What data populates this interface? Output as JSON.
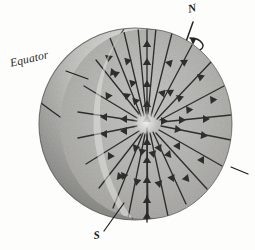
{
  "figure": {
    "background_color": "#fdfdfc",
    "ink_color": "#1d1d1d"
  },
  "labels": {
    "equator": "Equator",
    "north_pole": "N",
    "south_pole": "S"
  },
  "diagram_data": {
    "type": "diagram",
    "subject": "sphere-cutaway-radial-field",
    "sphere": {
      "center_x": 135,
      "center_y": 124,
      "radius": 96,
      "outer_surface_fill": "#b9b9b6",
      "outer_surface_shadow": "#8c8c8a",
      "outer_surface_highlight": "#e4e4e1",
      "cut_face_fill": "#b4b4b1",
      "cut_face_highlight": "#d8d8d5",
      "outline_color": "#3a3a38"
    },
    "cut_face": {
      "description": "wedge removed from the front-right revealing a flat circular cross-section",
      "center_x": 146,
      "center_y": 124,
      "radius_x": 86,
      "radius_y": 95
    },
    "field_lines": {
      "description": "gravitational field lines pointing inward toward the centre of the sphere",
      "direction": "inward",
      "count": 26,
      "convergence_x": 146,
      "convergence_y": 122,
      "chevrons_per_ray": 4,
      "line_color": "#2e2e2c"
    },
    "rotation_axis": {
      "label_top": "N",
      "label_bottom": "S",
      "tilt_degrees": 12,
      "rotation_arrow": "counter-clockwise ellipse around the axis near the north pole"
    },
    "equator_line": {
      "description": "great circle drawn across the visible outer surface at mid latitude",
      "stroke": "#2a2a28"
    },
    "leaders": [
      {
        "name": "equator-leader",
        "from": [
          68,
          72
        ],
        "to": [
          88,
          79
        ]
      },
      {
        "name": "south-leader",
        "from": [
          105,
          231
        ],
        "to": [
          123,
          204
        ]
      },
      {
        "name": "right-leader",
        "from": [
          232,
          168
        ],
        "to": [
          248,
          175
        ]
      }
    ]
  }
}
